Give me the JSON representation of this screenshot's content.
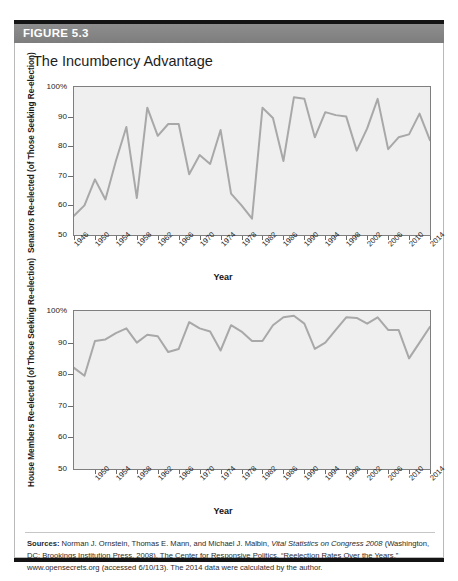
{
  "figure": {
    "number_label": "FIGURE 5.3",
    "title": "The Incumbency Advantage",
    "sources_prefix": "Sources:",
    "sources_part1": " Norman J. Ornstein, Thomas E. Mann, and Michael J. Malbin, ",
    "sources_italic": "Vital Statistics on Congress 2008",
    "sources_part2": " (Washington, DC: Brookings Institution Press, 2008). The Center for Responsive Politics, “Reelection Rates Over the Years,” www.opensecrets.org (accessed 6/10/13). The 2014 data were calculated by the author."
  },
  "colors": {
    "header_bar": "#858585",
    "rule": "#141414",
    "plot_background": "#efefef",
    "plot_border": "#7f7f7f",
    "line": "#a8a8a8",
    "text": "#1c1c1c"
  },
  "chart_data": [
    {
      "type": "line",
      "id": "senate",
      "title": "Senators Re-elected (of Those Seeking Re-election)",
      "ylabel_line1": "Senators Re-elected",
      "ylabel_line2": "(of Those Seeking Re-election)",
      "xlabel": "Year",
      "ylim": [
        50,
        100
      ],
      "yticks": [
        50,
        60,
        70,
        80,
        90,
        100
      ],
      "ytick_labels": [
        "50",
        "60",
        "70",
        "80",
        "90",
        "100%"
      ],
      "xlim": [
        1946,
        2014
      ],
      "xticks": [
        1946,
        1950,
        1954,
        1958,
        1962,
        1966,
        1970,
        1974,
        1978,
        1982,
        1986,
        1990,
        1994,
        1998,
        2002,
        2006,
        2010,
        2014
      ],
      "xtick_labels": [
        "1946",
        "1950",
        "1954",
        "1958",
        "1962",
        "1966",
        "1970",
        "1974",
        "1978",
        "1982",
        "1986",
        "1990",
        "1994",
        "1998",
        "2002",
        "2006",
        "2010",
        "2014"
      ],
      "grid": false,
      "legend": "none",
      "x": [
        1946,
        1948,
        1950,
        1952,
        1954,
        1956,
        1958,
        1960,
        1962,
        1964,
        1966,
        1968,
        1970,
        1972,
        1974,
        1976,
        1978,
        1980,
        1982,
        1984,
        1986,
        1988,
        1990,
        1992,
        1994,
        1996,
        1998,
        2000,
        2002,
        2004,
        2006,
        2008,
        2010,
        2012,
        2014
      ],
      "values": [
        56.5,
        60.0,
        68.8,
        62.0,
        75.0,
        86.5,
        62.5,
        93.0,
        83.5,
        87.5,
        87.5,
        70.5,
        77.0,
        74.0,
        85.5,
        64.0,
        60.0,
        55.5,
        93.0,
        89.5,
        75.0,
        96.5,
        96.0,
        83.0,
        91.5,
        90.5,
        90.0,
        78.5,
        86.0,
        96.0,
        79.0,
        83.0,
        84.0,
        91.0,
        82.0
      ]
    },
    {
      "type": "line",
      "id": "house",
      "title": "House Members Re-elected (of Those Seeking Re-election)",
      "ylabel_line1": "House Members Re-elected",
      "ylabel_line2": "(of Those Seeking Re-election)",
      "xlabel": "Year",
      "ylim": [
        50,
        100
      ],
      "yticks": [
        50,
        60,
        70,
        80,
        90,
        100
      ],
      "ytick_labels": [
        "50",
        "60",
        "70",
        "80",
        "90",
        "100%"
      ],
      "xlim": [
        1946,
        2014
      ],
      "xticks": [
        1950,
        1954,
        1958,
        1962,
        1966,
        1970,
        1974,
        1978,
        1982,
        1986,
        1990,
        1994,
        1998,
        2002,
        2006,
        2010,
        2014
      ],
      "xtick_labels": [
        "1950",
        "1954",
        "1958",
        "1962",
        "1966",
        "1970",
        "1974",
        "1978",
        "1982",
        "1986",
        "1990",
        "1994",
        "1998",
        "2002",
        "2006",
        "2010",
        "2014"
      ],
      "grid": false,
      "legend": "none",
      "x": [
        1946,
        1948,
        1950,
        1952,
        1954,
        1956,
        1958,
        1960,
        1962,
        1964,
        1966,
        1968,
        1970,
        1972,
        1974,
        1976,
        1978,
        1980,
        1982,
        1984,
        1986,
        1988,
        1990,
        1992,
        1994,
        1996,
        1998,
        2000,
        2002,
        2004,
        2006,
        2008,
        2010,
        2012,
        2014
      ],
      "values": [
        82.0,
        79.5,
        90.5,
        91.0,
        93.0,
        94.5,
        90.0,
        92.5,
        92.0,
        87.0,
        88.0,
        96.5,
        94.5,
        93.5,
        87.5,
        95.5,
        93.5,
        90.5,
        90.5,
        95.5,
        98.0,
        98.5,
        96.0,
        88.0,
        90.0,
        94.0,
        98.0,
        97.8,
        96.0,
        98.0,
        94.0,
        94.0,
        85.0,
        90.0,
        95.0
      ]
    }
  ]
}
